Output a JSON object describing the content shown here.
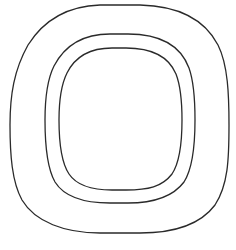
{
  "figure": {
    "stroke_color": "#2a2a2a",
    "background_color": "#ffffff",
    "shapes": [
      {
        "name": "outer",
        "left": 10,
        "right": 229,
        "top": 5,
        "bottom": 233
      },
      {
        "name": "middle",
        "left": 45,
        "right": 195,
        "top": 34,
        "bottom": 203
      },
      {
        "name": "inner",
        "left": 59,
        "right": 182,
        "top": 48,
        "bottom": 190
      }
    ]
  },
  "watermark": {
    "text": ""
  }
}
